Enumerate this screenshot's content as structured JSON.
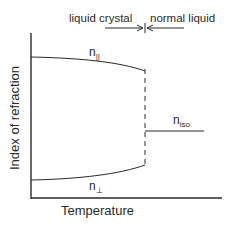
{
  "diagram": {
    "phase_labels": {
      "left": "liquid crystal",
      "right": "normal liquid"
    },
    "axes": {
      "xlabel": "Temperature",
      "ylabel": "Index of refraction"
    },
    "curves": {
      "n_parallel": {
        "base": "n",
        "sub": "||"
      },
      "n_perpendicular": {
        "base": "n",
        "sub": "⊥"
      },
      "n_iso": {
        "base": "n",
        "sub": "iso"
      }
    },
    "colors": {
      "line": "#2a2a2a",
      "background": "#ffffff"
    }
  }
}
